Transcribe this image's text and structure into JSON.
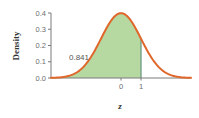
{
  "chart_data": {
    "type": "area",
    "title": "",
    "xlabel": "z",
    "ylabel": "Density",
    "curve": "standard normal density",
    "mean": 0,
    "sd": 1,
    "xlim": [
      -3.5,
      3.5
    ],
    "ylim": [
      0,
      0.4
    ],
    "y_ticks": [
      "0.0",
      "0.1",
      "0.2",
      "0.3",
      "0.4"
    ],
    "y_tick_values": [
      0.0,
      0.1,
      0.2,
      0.3,
      0.4
    ],
    "x_ticks": [
      "0",
      "1"
    ],
    "x_tick_values": [
      0,
      1
    ],
    "shaded_region": {
      "from": -3.5,
      "to": 1,
      "area": 0.841
    },
    "annotation": "0.841",
    "grid": false,
    "legend": null,
    "colors": {
      "curve": "#e0672b",
      "fill": "#b6d9a1",
      "boundary_line": "#6f9a86",
      "axis": "#7a7a7a"
    }
  }
}
